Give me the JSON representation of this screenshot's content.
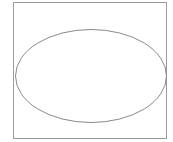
{
  "diagram": {
    "frame": {
      "x": 13.5,
      "y": 2.5,
      "width": 153,
      "height": 136,
      "stroke": "#9a9a9a"
    },
    "ellipse": {
      "cx": 91,
      "cy": 76,
      "rx": 75.5,
      "ry": 46.5,
      "stroke": "#8a8a8a"
    }
  }
}
